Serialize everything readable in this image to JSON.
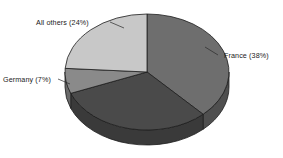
{
  "chart_data": {
    "type": "pie",
    "title": "",
    "subtitle": "",
    "xlabel": "",
    "ylabel": "",
    "legend_position": "none",
    "grid": false,
    "labels_shown_as": "callout labels with value in parentheses",
    "categories": [
      "France",
      "All others",
      "Germany",
      "Unlabeled slice"
    ],
    "values": [
      38,
      24,
      7,
      31
    ],
    "slices": [
      {
        "name": "France",
        "label": "France (38%)",
        "value": 38,
        "unit": "%",
        "color": "#6e6e6e",
        "side_color": "#4f4f4f",
        "start_angle_deg": 0,
        "end_angle_deg": 136.8,
        "label_x": 224,
        "label_y": 58,
        "label_anchor": "start",
        "leader": [
          [
            218,
            55
          ],
          [
            205,
            47
          ]
        ]
      },
      {
        "name": "Unlabeled slice",
        "label": "",
        "value": 31,
        "unit": "%",
        "color": "#4a4a4a",
        "side_color": "#3a3a3a",
        "start_angle_deg": 136.8,
        "end_angle_deg": 248.4,
        "label_x": 0,
        "label_y": 0,
        "label_anchor": "middle",
        "leader": []
      },
      {
        "name": "Germany",
        "label": "Germany (7%)",
        "value": 7,
        "unit": "%",
        "color": "#8a8a8a",
        "side_color": "#6a6a6a",
        "start_angle_deg": 248.4,
        "end_angle_deg": 273.6,
        "label_x": 3,
        "label_y": 82,
        "label_anchor": "start",
        "leader": [
          [
            58,
            79
          ],
          [
            70,
            84
          ]
        ]
      },
      {
        "name": "All others",
        "label": "All others (24%)",
        "value": 24,
        "unit": "%",
        "color": "#c8c8c8",
        "side_color": "#9a9a9a",
        "start_angle_deg": 273.6,
        "end_angle_deg": 360,
        "label_x": 36,
        "label_y": 25,
        "label_anchor": "start",
        "leader": [
          [
            110,
            22
          ],
          [
            124,
            28
          ]
        ]
      }
    ],
    "geometry": {
      "center_x": 147,
      "center_y": 72,
      "radius_x": 82,
      "radius_y": 58,
      "depth": 15,
      "start_angle_deg": 0,
      "direction": "clockwise",
      "outline_color": "#1e1e1e",
      "background": "#ffffff"
    }
  }
}
